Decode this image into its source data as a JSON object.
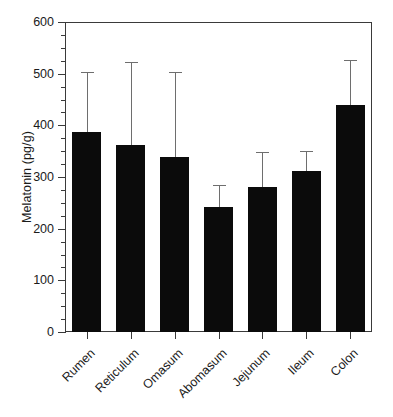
{
  "chart_data": {
    "type": "bar",
    "title": "",
    "subtitle": "",
    "xlabel": "",
    "ylabel": "Melatonin (pg/g)",
    "categories": [
      "Rumen",
      "Reticulum",
      "Omasum",
      "Abomasum",
      "Jejunum",
      "Ileum",
      "Colon"
    ],
    "values": [
      388,
      362,
      339,
      242,
      281,
      311,
      440
    ],
    "error_upper": [
      504,
      523,
      504,
      284,
      349,
      350,
      527
    ],
    "error_bars": [
      116,
      161,
      165,
      42,
      68,
      39,
      87
    ],
    "ylim": [
      0,
      600
    ],
    "ytick_labels": [
      "0",
      "100",
      "200",
      "300",
      "400",
      "500",
      "600"
    ],
    "ytick_values": [
      0,
      100,
      200,
      300,
      400,
      500,
      600
    ],
    "yminor_interval": 25,
    "grid": false,
    "legend": false,
    "legend_position": "none",
    "bar_color": "#0b0b0b",
    "error_bar_color": "#6e6e6e",
    "axis_color": "#3a3a3a",
    "text_color": "#1b1b1b",
    "background_color": "#ffffff",
    "error_bar_direction": "upper-only",
    "series": [
      {
        "name": "Melatonin",
        "values": [
          388,
          362,
          339,
          242,
          281,
          311,
          440
        ]
      }
    ]
  }
}
